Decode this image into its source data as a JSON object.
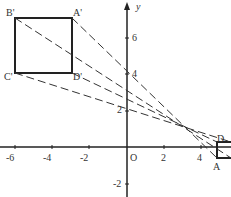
{
  "diagram": {
    "type": "dilation on coordinate plane",
    "axes": {
      "x_label": "",
      "y_label": "y",
      "origin_label": "O",
      "x_ticks": [
        "-6",
        "-4",
        "-2",
        "2",
        "4"
      ],
      "y_ticks": [
        "6",
        "4",
        "2",
        "-2"
      ]
    },
    "image_square": {
      "vertices": [
        {
          "label": "A'",
          "x": -3,
          "y": 7
        },
        {
          "label": "B'",
          "x": -6,
          "y": 7
        },
        {
          "label": "C'",
          "x": -6,
          "y": 4
        },
        {
          "label": "D'",
          "x": -3,
          "y": 4
        }
      ]
    },
    "original_square": {
      "vertices": [
        {
          "label": "A",
          "x": 5,
          "y": -1
        },
        {
          "label": "D",
          "x": 5,
          "y": 0
        }
      ]
    },
    "center_of_dilation": {
      "x": 3,
      "y": 1
    }
  }
}
